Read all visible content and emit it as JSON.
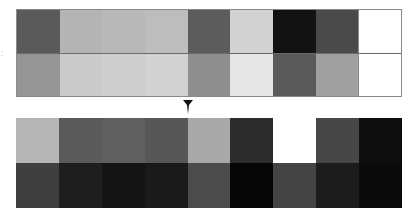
{
  "diagram": {
    "type": "grayscale-tile-transformation",
    "side_mark": ":",
    "arrow": {
      "direction": "down",
      "icon": "arrow-down-icon",
      "color": "#111111"
    },
    "top_grid": {
      "columns": 9,
      "rows": 2,
      "cells": [
        [
          "#5a5a5a",
          "#b4b4b4",
          "#b8b8b8",
          "#bdbdbd",
          "#5c5c5c",
          "#d2d2d2",
          "#121212",
          "#4a4a4a",
          "#ffffff"
        ],
        [
          "#959595",
          "#cacaca",
          "#cecece",
          "#d2d2d2",
          "#8e8e8e",
          "#e6e6e6",
          "#5a5a5a",
          "#a0a0a0",
          "#ffffff"
        ]
      ]
    },
    "bottom_grid": {
      "columns": 9,
      "rows": 2,
      "cells": [
        [
          "#b6b6b6",
          "#5a5a5a",
          "#606060",
          "#575757",
          "#a8a8a8",
          "#2c2c2c",
          "#ffffff",
          "#474747",
          "#0e0e0e"
        ],
        [
          "#3f3f3f",
          "#1e1e1e",
          "#141414",
          "#1a1a1a",
          "#4c4c4c",
          "#060606",
          "#444444",
          "#1c1c1c",
          "#0a0a0a"
        ]
      ]
    }
  }
}
